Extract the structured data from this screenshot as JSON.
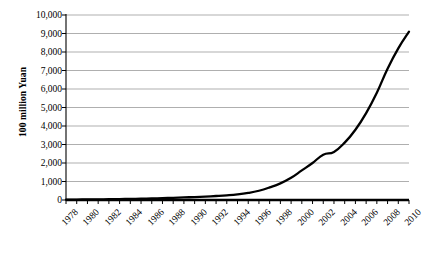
{
  "chart_data": {
    "type": "line",
    "title": "",
    "subtitle": "",
    "xlabel": "",
    "ylabel": "100 million Yuan",
    "xlim": [
      1978,
      2010
    ],
    "ylim": [
      0,
      10000
    ],
    "grid": true,
    "legend_position": "none",
    "line_color": "#000000",
    "grid_color": "#a6a6a6",
    "axis_color": "#000000",
    "background_color": "#ffffff",
    "ytick_labels": [
      "10,000",
      "9,000",
      "8,000",
      "7,000",
      "6,000",
      "5,000",
      "4,000",
      "3,000",
      "2,000",
      "1,000",
      "0"
    ],
    "ytick_values": [
      10000,
      9000,
      8000,
      7000,
      6000,
      5000,
      4000,
      3000,
      2000,
      1000,
      0
    ],
    "xtick_labels": [
      "1978",
      "1980",
      "1982",
      "1984",
      "1986",
      "1988",
      "1990",
      "1992",
      "1994",
      "1996",
      "1998",
      "2000",
      "2002",
      "2004",
      "2006",
      "2008",
      "2010"
    ],
    "xtick_values": [
      1978,
      1980,
      1982,
      1984,
      1986,
      1988,
      1990,
      1992,
      1994,
      1996,
      1998,
      2000,
      2002,
      2004,
      2006,
      2008,
      2010
    ],
    "minor_tick_interval": 1,
    "x": [
      1978,
      1979,
      1980,
      1981,
      1982,
      1983,
      1984,
      1985,
      1986,
      1987,
      1988,
      1989,
      1990,
      1991,
      1992,
      1993,
      1994,
      1995,
      1996,
      1997,
      1998,
      1999,
      2000,
      2001,
      2002,
      2003,
      2004,
      2005,
      2006,
      2007,
      2008,
      2009,
      2010
    ],
    "series": [
      {
        "name": "Value",
        "values": [
          20,
          25,
          30,
          35,
          42,
          50,
          60,
          72,
          85,
          100,
          120,
          140,
          160,
          185,
          215,
          250,
          300,
          380,
          500,
          680,
          900,
          1200,
          1600,
          2000,
          2450,
          2600,
          3100,
          3800,
          4700,
          5800,
          7100,
          8200,
          9100
        ]
      }
    ],
    "axis_geometry": {
      "plot_left_px": 66,
      "plot_right_px": 409,
      "plot_top_px": 15,
      "plot_bottom_px": 200
    }
  }
}
